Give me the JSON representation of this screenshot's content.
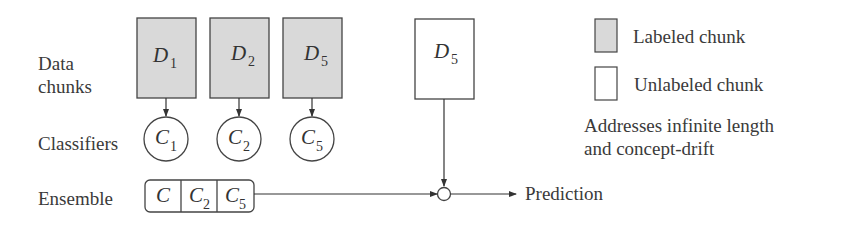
{
  "row_labels": {
    "data_chunks_line1": "Data",
    "data_chunks_line2": "chunks",
    "classifiers": "Classifiers",
    "ensemble": "Ensemble"
  },
  "data_chunks": [
    {
      "symbol": "D",
      "subscript": "1",
      "type": "labeled"
    },
    {
      "symbol": "D",
      "subscript": "2",
      "type": "labeled"
    },
    {
      "symbol": "D",
      "subscript": "5",
      "type": "labeled"
    }
  ],
  "new_chunk": {
    "symbol": "D",
    "subscript": "5",
    "type": "unlabeled"
  },
  "classifiers": [
    {
      "symbol": "C",
      "subscript": "1"
    },
    {
      "symbol": "C",
      "subscript": "2"
    },
    {
      "symbol": "C",
      "subscript": "5"
    }
  ],
  "ensemble": [
    {
      "symbol": "C",
      "subscript": ""
    },
    {
      "symbol": "C",
      "subscript": "2"
    },
    {
      "symbol": "C",
      "subscript": "5"
    }
  ],
  "output_label": "Prediction",
  "legend": {
    "labeled": "Labeled chunk",
    "unlabeled": "Unlabeled chunk"
  },
  "note": {
    "line1": "Addresses infinite length",
    "line2": "and concept-drift"
  },
  "colors": {
    "labeled_fill": "#d9d9d9",
    "unlabeled_fill": "#ffffff",
    "stroke": "#444444",
    "text": "#333333"
  }
}
